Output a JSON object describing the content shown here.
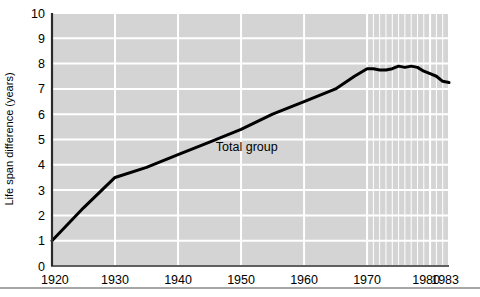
{
  "chart_data": {
    "type": "line",
    "title": "",
    "subtitle": "",
    "xlabel": "",
    "ylabel": "Life span difference (years)",
    "xlim": [
      1920,
      1983
    ],
    "ylim": [
      0,
      10
    ],
    "grid": true,
    "legend_position": "inline-annotation",
    "annotations": [
      {
        "text": "Total group",
        "x": 1946,
        "y": 4.55
      }
    ],
    "xticks": [
      1920,
      1930,
      1940,
      1950,
      1960,
      1970,
      1980,
      1983
    ],
    "xtick_labels": [
      "1920",
      "1930",
      "1940",
      "1950",
      "1960",
      "1970",
      "1980",
      "1983"
    ],
    "yticks": [
      0,
      1,
      2,
      3,
      4,
      5,
      6,
      7,
      8,
      9,
      10
    ],
    "ytick_labels": [
      "0",
      "1",
      "2",
      "3",
      "4",
      "5",
      "6",
      "7",
      "8",
      "9",
      "10"
    ],
    "minor_xgrid_from": 1970,
    "minor_xgrid_step": 1,
    "series": [
      {
        "name": "Total group",
        "color": "#000000",
        "x": [
          1920,
          1925,
          1930,
          1935,
          1940,
          1945,
          1950,
          1955,
          1960,
          1965,
          1968,
          1970,
          1971,
          1972,
          1973,
          1974,
          1975,
          1976,
          1977,
          1978,
          1979,
          1980,
          1981,
          1982,
          1983
        ],
        "values": [
          1.0,
          2.3,
          3.5,
          3.9,
          4.4,
          4.9,
          5.4,
          6.0,
          6.5,
          7.0,
          7.5,
          7.8,
          7.8,
          7.75,
          7.75,
          7.8,
          7.9,
          7.85,
          7.9,
          7.85,
          7.7,
          7.6,
          7.5,
          7.3,
          7.25
        ]
      }
    ]
  },
  "figure": {
    "plot_bg_color": "#d4d4d4",
    "grid_color": "#ffffff",
    "axis_color": "#2b2b2b",
    "line_color": "#000000",
    "footer_rule_color": "#8a8a8a"
  }
}
